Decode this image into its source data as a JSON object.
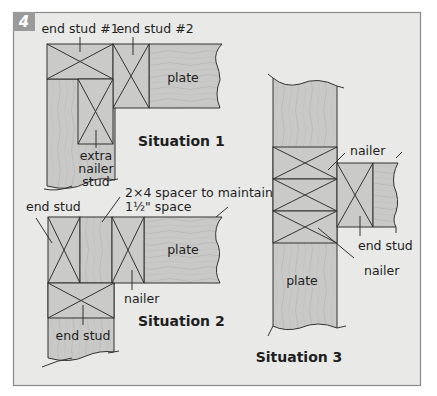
{
  "figure": {
    "number": "4",
    "colors": {
      "panel_bg": "#e9e9e8",
      "panel_border": "#8a8a8a",
      "badge_bg": "#9a9a9a",
      "badge_text": "#ffffff",
      "wood": "#c9c9c7",
      "wood_grain": "#b4b4b2",
      "line": "#333333"
    }
  },
  "situation1": {
    "title": "Situation 1",
    "labels": {
      "end_stud_1": "end stud #1",
      "end_stud_2": "end stud #2",
      "plate": "plate",
      "extra_line1": "extra",
      "extra_line2": "nailer",
      "extra_line3": "stud"
    }
  },
  "situation2": {
    "title": "Situation 2",
    "labels": {
      "end_stud_top": "end stud",
      "spacer_line1": "2×4 spacer to maintain",
      "spacer_line2": "1½\" space",
      "plate": "plate",
      "nailer": "nailer",
      "end_stud_bottom": "end stud"
    }
  },
  "situation3": {
    "title": "Situation 3",
    "labels": {
      "nailer_top": "nailer",
      "end_stud": "end stud",
      "nailer_bottom": "nailer",
      "plate": "plate"
    }
  }
}
